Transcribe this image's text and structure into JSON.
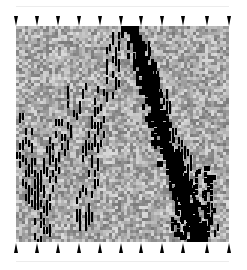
{
  "figure": {
    "specimen": {
      "x": 16,
      "y": 26,
      "width": 213,
      "height": 216,
      "cell_size": 3
    },
    "colors": {
      "background": "#ffffff",
      "damage": "#000000",
      "field_min": "#6e6e6e",
      "field_max": "#e0e0e0",
      "arrow": "#000000",
      "guide_line": "#ececec"
    },
    "top_arrows": {
      "direction": "down",
      "count": 11,
      "y": 16,
      "x_positions": [
        16,
        37,
        58,
        79,
        100,
        121,
        141,
        162,
        183,
        207,
        229
      ]
    },
    "bottom_arrows": {
      "direction": "up",
      "count": 11,
      "y": 243,
      "x_positions": [
        16,
        37,
        58,
        79,
        100,
        121,
        141,
        162,
        183,
        207,
        229
      ]
    },
    "guide_lines": {
      "top_y": 6,
      "bottom_y": 261
    },
    "main_crack": [
      [
        115,
        0
      ],
      [
        118,
        10
      ],
      [
        122,
        22
      ],
      [
        126,
        36
      ],
      [
        130,
        52
      ],
      [
        136,
        70
      ],
      [
        140,
        86
      ],
      [
        144,
        102
      ],
      [
        148,
        118
      ],
      [
        152,
        132
      ],
      [
        158,
        146
      ],
      [
        164,
        158
      ],
      [
        168,
        172
      ],
      [
        172,
        186
      ],
      [
        176,
        200
      ],
      [
        180,
        216
      ]
    ],
    "secondary_cracks": [
      [
        [
          100,
          10
        ],
        [
          96,
          40
        ],
        [
          88,
          70
        ],
        [
          80,
          100
        ],
        [
          74,
          130
        ],
        [
          70,
          160
        ],
        [
          66,
          190
        ]
      ],
      [
        [
          60,
          60
        ],
        [
          50,
          90
        ],
        [
          40,
          120
        ],
        [
          30,
          150
        ],
        [
          22,
          180
        ]
      ],
      [
        [
          4,
          90
        ],
        [
          8,
          120
        ],
        [
          14,
          150
        ],
        [
          20,
          180
        ],
        [
          26,
          205
        ]
      ],
      [
        [
          150,
          100
        ],
        [
          160,
          120
        ],
        [
          168,
          140
        ],
        [
          178,
          160
        ],
        [
          186,
          180
        ],
        [
          192,
          200
        ]
      ],
      [
        [
          124,
          20
        ],
        [
          130,
          40
        ],
        [
          140,
          60
        ],
        [
          146,
          90
        ]
      ]
    ]
  }
}
